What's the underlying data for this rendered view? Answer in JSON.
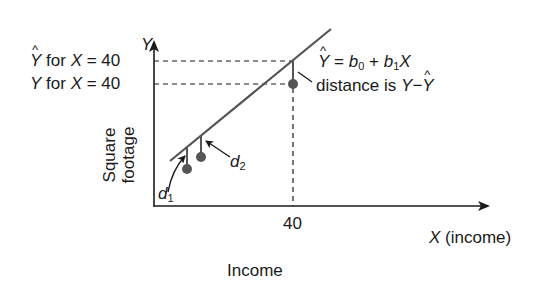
{
  "diagram": {
    "y_axis_symbol": "Y",
    "x_axis_label": "X (income)",
    "x_axis_symbol": "X",
    "x_axis_unit": "(income)",
    "y_axis_label_line1": "Square",
    "y_axis_label_line2": "footage",
    "caption": "Income",
    "x_tick": "40",
    "yhat_label": {
      "symbol": "Y",
      "text": " for ",
      "var": "X",
      "eq": " = 40"
    },
    "y_label": {
      "symbol": "Y",
      "text": " for ",
      "var": "X",
      "eq": " = 40"
    },
    "equation": {
      "lhs": "Y",
      "eq": " = ",
      "b0": "b",
      "b0_sub": "0",
      "plus": " + ",
      "b1": "b",
      "b1_sub": "1",
      "x": "X"
    },
    "distance": {
      "text": "distance is ",
      "y": "Y",
      "minus": "−",
      "yhat": "Y"
    },
    "d1": {
      "letter": "d",
      "sub": "1"
    },
    "d2": {
      "letter": "d",
      "sub": "2"
    },
    "colors": {
      "ink": "#1a1a1a",
      "line": "#555555",
      "point": "#555555"
    }
  }
}
